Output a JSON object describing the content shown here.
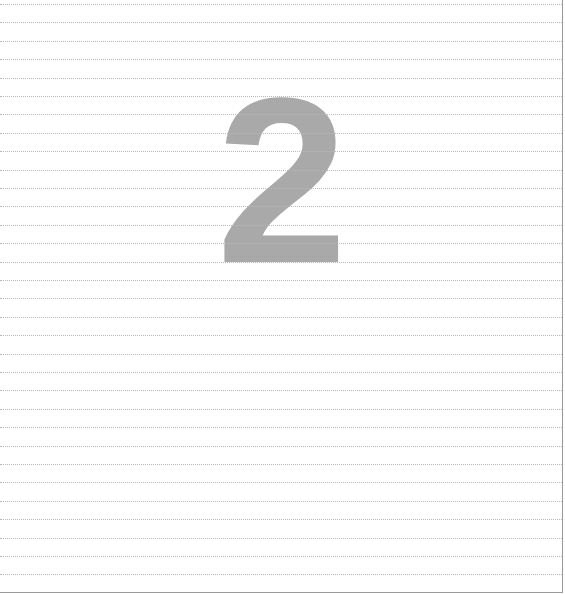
{
  "page": {
    "numeral": "2",
    "numeral_color": "#a9a9a9",
    "rule_color": "#b8b8b8",
    "border_color": "#9a9a9a",
    "rule_count": 32,
    "rule_first_y": 4,
    "rule_spacing": 18.4
  }
}
